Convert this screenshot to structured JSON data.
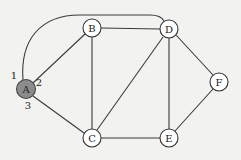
{
  "diagram": {
    "type": "graph",
    "nodes": [
      {
        "id": "A",
        "label": "A",
        "x": 26,
        "y": 89,
        "highlighted": true
      },
      {
        "id": "B",
        "label": "B",
        "x": 92,
        "y": 28,
        "highlighted": false
      },
      {
        "id": "C",
        "label": "C",
        "x": 92,
        "y": 138,
        "highlighted": false
      },
      {
        "id": "D",
        "label": "D",
        "x": 169,
        "y": 29,
        "highlighted": false
      },
      {
        "id": "E",
        "label": "E",
        "x": 169,
        "y": 138,
        "highlighted": false
      },
      {
        "id": "F",
        "label": "F",
        "x": 219,
        "y": 82,
        "highlighted": false
      }
    ],
    "edges": [
      {
        "from": "A",
        "to": "D",
        "port": "1",
        "curved": true
      },
      {
        "from": "A",
        "to": "B",
        "port": "2"
      },
      {
        "from": "A",
        "to": "C",
        "port": "3"
      },
      {
        "from": "B",
        "to": "D"
      },
      {
        "from": "B",
        "to": "C"
      },
      {
        "from": "C",
        "to": "D"
      },
      {
        "from": "C",
        "to": "E"
      },
      {
        "from": "D",
        "to": "E"
      },
      {
        "from": "D",
        "to": "F"
      },
      {
        "from": "E",
        "to": "F"
      }
    ],
    "port_labels": [
      {
        "text": "1",
        "x": 14,
        "y": 75
      },
      {
        "text": "2",
        "x": 39,
        "y": 82
      },
      {
        "text": "3",
        "x": 28,
        "y": 105
      }
    ],
    "colors": {
      "background": "#f2f2f0",
      "edge": "#3a3a3a",
      "node_fill": "#ffffff",
      "highlight_fill": "#8c8c8c"
    }
  }
}
